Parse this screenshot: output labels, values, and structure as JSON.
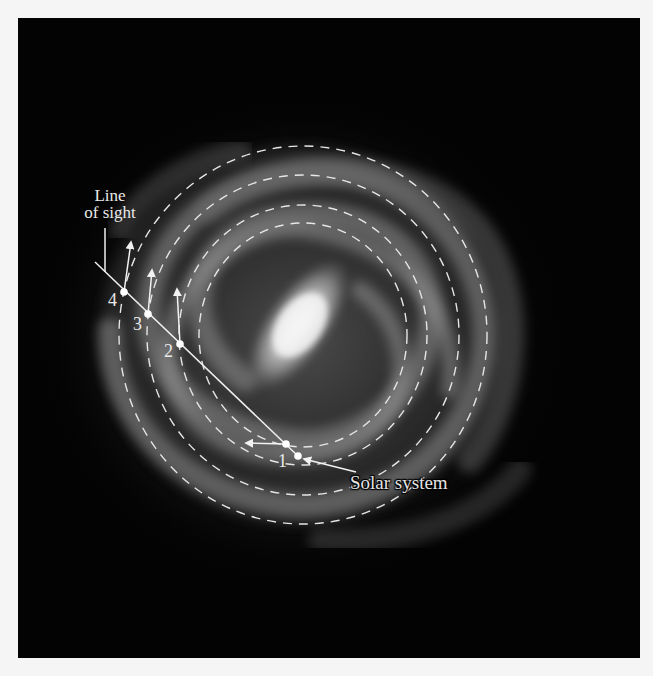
{
  "figure": {
    "background_color": "#030303",
    "page_color": "#f5f5f5",
    "annotation_color": "#eeeeee"
  },
  "labels": {
    "line_of_sight_line1": "Line",
    "line_of_sight_line2": "of sight",
    "solar_system": "Solar system"
  },
  "points": [
    {
      "id": "1",
      "label": "1",
      "x": 286,
      "y": 444,
      "arrow_to": [
        244,
        443
      ]
    },
    {
      "id": "2",
      "label": "2",
      "x": 180,
      "y": 344,
      "arrow_to": [
        177,
        287
      ]
    },
    {
      "id": "3",
      "label": "3",
      "x": 148,
      "y": 314,
      "arrow_to": [
        152,
        268
      ]
    },
    {
      "id": "4",
      "label": "4",
      "x": 124,
      "y": 292,
      "arrow_to": [
        131,
        240
      ]
    }
  ],
  "sun": {
    "x": 298,
    "y": 456
  },
  "orbits": [
    {
      "rx": 104,
      "ry": 112
    },
    {
      "rx": 124,
      "ry": 130
    },
    {
      "rx": 156,
      "ry": 160
    },
    {
      "rx": 184,
      "ry": 189
    }
  ],
  "galactic_center": {
    "x": 303,
    "y": 335
  }
}
